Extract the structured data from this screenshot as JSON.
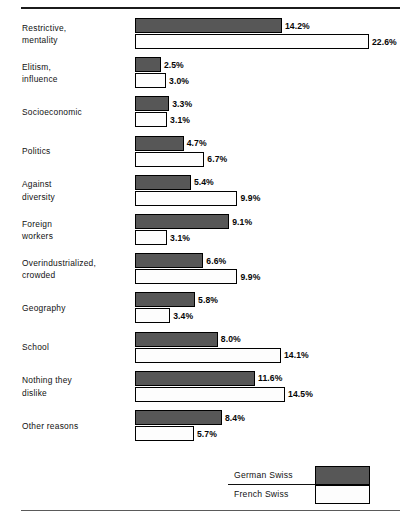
{
  "chart_data": {
    "type": "bar",
    "title": "",
    "subtitle": "",
    "xlabel": "",
    "ylabel": "",
    "orientation": "horizontal",
    "grid": false,
    "legend_position": "bottom-right",
    "value_suffix": "%",
    "xlim": [
      0,
      22.6
    ],
    "px_per_unit": 10.35,
    "categories": [
      "Restrictive, mentality",
      "Elitism, influence",
      "Socioeconomic",
      "Politics",
      "Against diversity",
      "Foreign workers",
      "Overindustrialized, crowded",
      "Geography",
      "School",
      "Nothing they dislike",
      "Other reasons"
    ],
    "category_lines": [
      [
        "Restrictive,",
        "mentality"
      ],
      [
        "Elitism,",
        "influence"
      ],
      [
        "Socioeconomic"
      ],
      [
        "Politics"
      ],
      [
        "Against",
        "diversity"
      ],
      [
        "Foreign",
        "workers"
      ],
      [
        "Overindustrialized,",
        "crowded"
      ],
      [
        "Geography"
      ],
      [
        "School"
      ],
      [
        "Nothing they",
        "dislike"
      ],
      [
        "Other reasons"
      ]
    ],
    "series": [
      {
        "name": "German Swiss",
        "color": "#575757",
        "values": [
          14.2,
          2.5,
          3.3,
          4.7,
          5.4,
          9.1,
          6.6,
          5.8,
          8.0,
          11.6,
          8.4
        ],
        "labels": [
          "14.2%",
          "2.5%",
          "3.3%",
          "4.7%",
          "5.4%",
          "9.1%",
          "6.6%",
          "5.8%",
          "8.0%",
          "11.6%",
          "8.4%"
        ]
      },
      {
        "name": "French Swiss",
        "color": "#fdfdfd",
        "values": [
          22.6,
          3.0,
          3.1,
          6.7,
          9.9,
          3.1,
          9.9,
          3.4,
          14.1,
          14.5,
          5.7
        ],
        "labels": [
          "22.6%",
          "3.0%",
          "3.1%",
          "6.7%",
          "9.9%",
          "3.1%",
          "9.9%",
          "3.4%",
          "14.1%",
          "14.5%",
          "5.7%"
        ]
      }
    ]
  },
  "legend": {
    "items": [
      {
        "label": "German Swiss",
        "swatch": "german"
      },
      {
        "label": "French Swiss",
        "swatch": "french"
      }
    ]
  }
}
